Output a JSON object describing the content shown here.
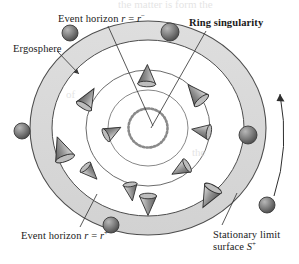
{
  "figure": {
    "kind": "kerr-black-hole-cross-section",
    "title_visible": false
  },
  "labels": {
    "event_horizon_inner": {
      "text_main": "Event horizon ",
      "var_r": "r",
      "equals": " = ",
      "var_r2": "r",
      "sup": "−",
      "full": "Event horizon r = r−"
    },
    "ring_singularity": "Ring singularity",
    "ergosphere": "Ergosphere",
    "event_horizon_outer": {
      "text_main": "Event horizon ",
      "var_r": "r",
      "equals": " = ",
      "var_r2": "r",
      "sup": "+",
      "full": "Event horizon r = r+"
    },
    "stationary_limit": {
      "line1": "Stationary limit",
      "line2_prefix": "surface ",
      "line2_var": "S",
      "line2_sup": "+"
    }
  },
  "colors": {
    "ink": "#1a1a1a",
    "ergosphere_fill": "#d9d9d9",
    "interior_fill": "#ffffff",
    "cone_dark": "#4a4a4a",
    "cone_light": "#d0d0d0",
    "sphere_dark": "#5a5a5a",
    "sphere_light": "#bdbdbd",
    "stroke": "#4d4d4d",
    "background": "#ffffff"
  },
  "geometry": {
    "center": {
      "cx": 148,
      "cy": 128
    },
    "circles": [
      {
        "name": "stationary-limit-surface",
        "rx": 118,
        "ry": 107,
        "label": "S+"
      },
      {
        "name": "event-horizon-outer",
        "rx": 96,
        "ry": 88,
        "label": "r+"
      },
      {
        "name": "event-horizon-inner",
        "rx": 62,
        "ry": 58,
        "label": "r-"
      },
      {
        "name": "inner-circle",
        "rx": 40,
        "ry": 38,
        "label": "inner"
      },
      {
        "name": "ring-singularity",
        "rx": 20,
        "ry": 19,
        "label": "ring"
      }
    ]
  },
  "light_cones": [
    {
      "id": "cone-1",
      "x": 62,
      "y": 150,
      "rot": -20,
      "size": 15,
      "tilt": "outward"
    },
    {
      "id": "cone-2",
      "x": 86,
      "y": 98,
      "rot": 28,
      "size": 13,
      "tilt": "inward"
    },
    {
      "id": "cone-3",
      "x": 111,
      "y": 131,
      "rot": 60,
      "size": 11,
      "tilt": "inward"
    },
    {
      "id": "cone-4",
      "x": 147,
      "y": 75,
      "rot": 0,
      "size": 13,
      "tilt": "down"
    },
    {
      "id": "cone-5",
      "x": 195,
      "y": 93,
      "rot": -38,
      "size": 14,
      "tilt": "inward"
    },
    {
      "id": "cone-6",
      "x": 201,
      "y": 130,
      "rot": -78,
      "size": 12,
      "tilt": "inward"
    },
    {
      "id": "cone-7",
      "x": 180,
      "y": 168,
      "rot": -118,
      "size": 12,
      "tilt": "inward"
    },
    {
      "id": "cone-8",
      "x": 130,
      "y": 190,
      "rot": 170,
      "size": 11,
      "tilt": "inward"
    },
    {
      "id": "cone-9",
      "x": 89,
      "y": 171,
      "rot": 135,
      "size": 11,
      "tilt": "inward"
    },
    {
      "id": "cone-10",
      "x": 148,
      "y": 203,
      "rot": 180,
      "size": 13,
      "tilt": "up"
    },
    {
      "id": "cone-11",
      "x": 209,
      "y": 195,
      "rot": -150,
      "size": 14,
      "tilt": "inward"
    }
  ],
  "spheres": [
    {
      "id": "sphere-outside-topleft",
      "x": 70,
      "y": 33,
      "r": 8
    },
    {
      "id": "sphere-on-limit-topright",
      "x": 170,
      "y": 32,
      "r": 9
    },
    {
      "id": "sphere-outside-left",
      "x": 22,
      "y": 131,
      "r": 8
    },
    {
      "id": "sphere-on-limit-right",
      "x": 248,
      "y": 135,
      "r": 9
    },
    {
      "id": "sphere-on-limit-bottom",
      "x": 111,
      "y": 225,
      "r": 8
    },
    {
      "id": "sphere-outside-bottomright",
      "x": 267,
      "y": 205,
      "r": 8
    }
  ],
  "rotation_arrow": {
    "id": "rotation-arrow",
    "description": "curved arrow on right indicating black hole rotation direction",
    "direction": "counterclockwise-upward"
  },
  "leaders": [
    {
      "from_label": "event_horizon_inner",
      "x1": 108,
      "y1": 26,
      "x2": 153,
      "y2": 126
    },
    {
      "from_label": "ring_singularity",
      "x1": 206,
      "y1": 30,
      "x2": 150,
      "y2": 129
    },
    {
      "from_label": "ergosphere",
      "x1": 58,
      "y1": 52,
      "x2": 80,
      "y2": 76
    },
    {
      "from_label": "event_horizon_outer",
      "x1": 80,
      "y1": 228,
      "x2": 96,
      "y2": 196
    },
    {
      "from_label": "stationary_limit",
      "x1": 222,
      "y1": 226,
      "x2": 236,
      "y2": 196
    }
  ],
  "ghost_text": {
    "note": "faint bleed-through text from reverse side of page",
    "lines": [
      {
        "text": "the matter is form the",
        "x": 120,
        "y": 6
      },
      {
        "text": "of",
        "x": 70,
        "y": 92
      },
      {
        "text": "the",
        "x": 196,
        "y": 150
      }
    ]
  }
}
